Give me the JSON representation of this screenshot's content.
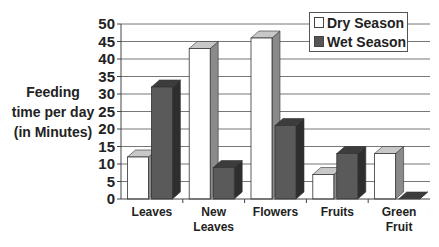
{
  "chart_data": {
    "type": "bar",
    "title": "",
    "xlabel": "",
    "ylabel": "Feeding time per day (in Minutes)",
    "ylabel_lines": [
      "Feeding",
      "time per day",
      "(in Minutes)"
    ],
    "categories": [
      "Leaves",
      "New Leaves",
      "Flowers",
      "Fruits",
      "Green Fruit"
    ],
    "category_lines": [
      [
        "Leaves"
      ],
      [
        "New",
        "Leaves"
      ],
      [
        "Flowers"
      ],
      [
        "Fruits"
      ],
      [
        "Green",
        "Fruit"
      ]
    ],
    "series": [
      {
        "name": "Dry Season",
        "color": "#ffffff",
        "values": [
          12,
          43,
          46,
          7,
          13
        ]
      },
      {
        "name": "Wet Season",
        "color": "#555555",
        "values": [
          32,
          9,
          21,
          13,
          0
        ]
      }
    ],
    "ylim": [
      0,
      50
    ],
    "yticks": [
      0,
      5,
      10,
      15,
      20,
      25,
      30,
      35,
      40,
      45,
      50
    ],
    "grid": true,
    "legend_position": "top-right",
    "style": "3d-clustered-column"
  },
  "legend": {
    "items": [
      {
        "label": "Dry Season",
        "color": "#ffffff"
      },
      {
        "label": "Wet Season",
        "color": "#555555"
      }
    ]
  }
}
